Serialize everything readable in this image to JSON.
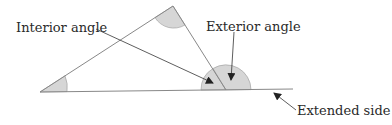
{
  "diagram": {
    "labels": {
      "interior_angle": "Interior angle",
      "exterior_angle": "Exterior angle",
      "extended_side": "Extended side"
    },
    "colors": {
      "line": "#888888",
      "angle_fill": "#d6d6d6",
      "arrow": "#222222",
      "text": "#2a2a2a"
    },
    "triangle": {
      "vertices": [
        [
          40,
          92
        ],
        [
          173,
          6
        ],
        [
          226,
          90
        ]
      ],
      "extended_side_end": [
        293,
        89
      ]
    }
  }
}
